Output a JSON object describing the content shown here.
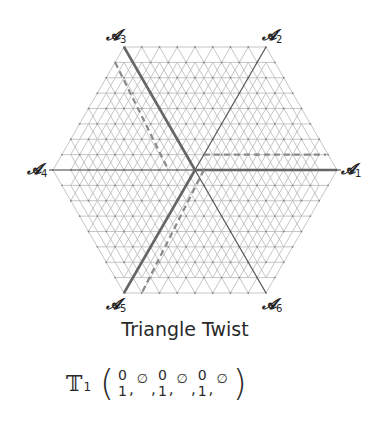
{
  "diagram": {
    "title": "Triangle Twist",
    "geometry": {
      "center": [
        195,
        170
      ],
      "radius": 142,
      "divisions": 8
    },
    "vertices": [
      {
        "id": "A1",
        "symbol": "𝓐",
        "index": "1",
        "pos": [
          337,
          170
        ]
      },
      {
        "id": "A2",
        "symbol": "𝓐",
        "index": "2",
        "pos": [
          266,
          47
        ]
      },
      {
        "id": "A3",
        "symbol": "𝓐",
        "index": "3",
        "pos": [
          124,
          47
        ]
      },
      {
        "id": "A4",
        "symbol": "𝓐",
        "index": "4",
        "pos": [
          53,
          170
        ]
      },
      {
        "id": "A5",
        "symbol": "𝓐",
        "index": "5",
        "pos": [
          124,
          293
        ]
      },
      {
        "id": "A6",
        "symbol": "𝓐",
        "index": "6",
        "pos": [
          266,
          293
        ]
      }
    ],
    "colors": {
      "grid": "#b8b8b8",
      "grid_dot": "#888888",
      "axis": "#5a5a5a",
      "bold_path": "#666666",
      "dashed_path": "#8a8a8a",
      "text": "#2a2a2a"
    },
    "formula": {
      "operator": "𝕋",
      "operator_index": "1",
      "open_paren": "(",
      "close_paren": ")",
      "terms": [
        {
          "type": "stack",
          "top": "0",
          "bottom": "1"
        },
        {
          "type": "empty",
          "value": "∅"
        },
        {
          "type": "stack",
          "top": "0",
          "bottom": "1"
        },
        {
          "type": "empty",
          "value": "∅"
        },
        {
          "type": "stack",
          "top": "0",
          "bottom": "1"
        },
        {
          "type": "empty",
          "value": "∅"
        }
      ],
      "separator": ","
    }
  }
}
